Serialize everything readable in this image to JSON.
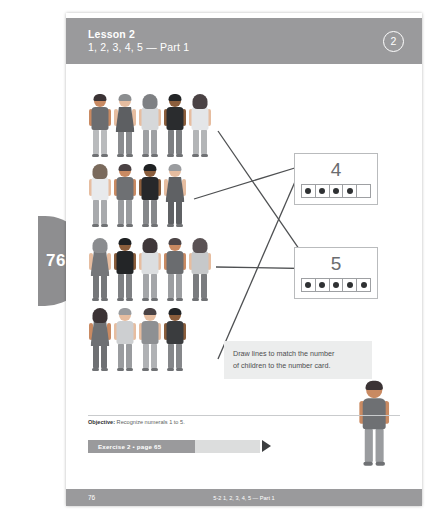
{
  "page": {
    "tab_number": "76",
    "footer_number": "76",
    "footer_center": "5-2 1, 2, 3, 4, 5 — Part 1"
  },
  "header": {
    "lesson_title": "Lesson 2",
    "lesson_subtitle": "1, 2, 3, 4, 5 — Part 1",
    "badge": "2"
  },
  "instruction": {
    "line1": "Draw lines to match the number",
    "line2": "of children to the number card."
  },
  "objective": {
    "label": "Objective:",
    "text": "Recognize numerals 1 to 5."
  },
  "exercise": {
    "banner": "Exercise 2 • page 65",
    "arrow_icon": "triangle-right-icon"
  },
  "cards": [
    {
      "numeral": "4",
      "dots_filled": 4,
      "dots_total": 5
    },
    {
      "numeral": "5",
      "dots_filled": 5,
      "dots_total": 5
    }
  ],
  "colors": {
    "header_band": "#9a9a9c",
    "page_tab": "#8e8e90",
    "instruction_bg": "#eceded",
    "line_stroke": "#4e5052"
  },
  "child_rows": [
    {
      "count": 5,
      "kids": [
        {
          "skin": "#c98a62",
          "hair": "#3b3335",
          "hair_style": "short",
          "top": "#6b6d70",
          "bottom": "#b9bbbd",
          "outfit": "shirt"
        },
        {
          "skin": "#e6bda0",
          "hair": "#8c8e90",
          "hair_style": "short",
          "top": "#5d5f62",
          "bottom": "#8a8c8f",
          "outfit": "dress"
        },
        {
          "skin": "#e6bda0",
          "hair": "#7e8083",
          "hair_style": "long",
          "top": "#d6d8da",
          "bottom": "#9ea0a3",
          "outfit": "shirt"
        },
        {
          "skin": "#8b5e3c",
          "hair": "#232527",
          "hair_style": "spiky",
          "top": "#2a2c2e",
          "bottom": "#7d7f82",
          "outfit": "shirt"
        },
        {
          "skin": "#e6bda0",
          "hair": "#4a4244",
          "hair_style": "long",
          "top": "#e4e6e8",
          "bottom": "#b3b5b7",
          "outfit": "shirt"
        }
      ]
    },
    {
      "count": 4,
      "kids": [
        {
          "skin": "#e6bda0",
          "hair": "#7a6a5c",
          "hair_style": "long",
          "top": "#e8eaec",
          "bottom": "#a8aaad",
          "outfit": "shirt"
        },
        {
          "skin": "#c98a62",
          "hair": "#4a4244",
          "hair_style": "short",
          "top": "#6e7073",
          "bottom": "#9a9c9f",
          "outfit": "shirt"
        },
        {
          "skin": "#8b5e3c",
          "hair": "#1f2123",
          "hair_style": "spiky",
          "top": "#26282a",
          "bottom": "#86888b",
          "outfit": "shirt"
        },
        {
          "skin": "#e6bda0",
          "hair": "#9a9c9f",
          "hair_style": "short",
          "top": "#5f6164",
          "bottom": "#5f6164",
          "outfit": "dress"
        }
      ]
    },
    {
      "count": 5,
      "kids": [
        {
          "skin": "#e6bda0",
          "hair": "#8a8c8f",
          "hair_style": "long",
          "top": "#75777a",
          "bottom": "#75777a",
          "outfit": "dress"
        },
        {
          "skin": "#8b5e3c",
          "hair": "#1f2123",
          "hair_style": "spiky",
          "top": "#232527",
          "bottom": "#7e8083",
          "outfit": "shirt"
        },
        {
          "skin": "#e6bda0",
          "hair": "#3f3739",
          "hair_style": "long",
          "top": "#dcdee0",
          "bottom": "#a4a6a9",
          "outfit": "shirt"
        },
        {
          "skin": "#c98a62",
          "hair": "#4e4648",
          "hair_style": "short",
          "top": "#6a6c6f",
          "bottom": "#9c9ea1",
          "outfit": "shirt"
        },
        {
          "skin": "#e6bda0",
          "hair": "#5a5254",
          "hair_style": "long",
          "top": "#c6c8ca",
          "bottom": "#7a7c7f",
          "outfit": "shirt"
        }
      ]
    },
    {
      "count": 4,
      "kids": [
        {
          "skin": "#c98a62",
          "hair": "#3b3335",
          "hair_style": "long",
          "top": "#6e7073",
          "bottom": "#6e7073",
          "outfit": "dress"
        },
        {
          "skin": "#e6bda0",
          "hair": "#9a9c9f",
          "hair_style": "short",
          "top": "#cdcfd1",
          "bottom": "#9a9c9f",
          "outfit": "shirt"
        },
        {
          "skin": "#e6bda0",
          "hair": "#4a4244",
          "hair_style": "short",
          "top": "#8e9093",
          "bottom": "#b0b2b5",
          "outfit": "shirt"
        },
        {
          "skin": "#8b5e3c",
          "hair": "#232527",
          "hair_style": "spiky",
          "top": "#3a3c3e",
          "bottom": "#85878a",
          "outfit": "shirt"
        }
      ]
    }
  ],
  "lone_kid": {
    "skin": "#c98a62",
    "hair": "#3b3335",
    "hair_style": "short",
    "top": "#6e7073",
    "bottom": "#9a9c9f",
    "outfit": "shirt"
  },
  "match_lines": [
    {
      "from_row": 1,
      "x1": 152,
      "y1": 62,
      "x2": 262,
      "y2": 222
    },
    {
      "from_row": 2,
      "x1": 128,
      "y1": 130,
      "x2": 232,
      "y2": 98
    },
    {
      "from_row": 3,
      "x1": 150,
      "y1": 198,
      "x2": 266,
      "y2": 200
    },
    {
      "from_row": 4,
      "x1": 152,
      "y1": 290,
      "x2": 238,
      "y2": 92
    }
  ]
}
